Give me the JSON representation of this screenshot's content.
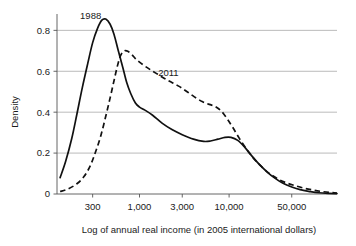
{
  "chart_data": {
    "type": "line",
    "title": "",
    "xlabel": "Log of annual real income (in 2005 international dollars)",
    "ylabel": "Density",
    "xscale": "log",
    "xlim": [
      120,
      160000
    ],
    "ylim": [
      0,
      0.88
    ],
    "xticks": [
      300,
      1000,
      3000,
      10000,
      50000
    ],
    "xtick_labels": [
      "300",
      "1,000",
      "3,000",
      "10,000",
      "50,000"
    ],
    "yticks": [
      0,
      0.2,
      0.4,
      0.6,
      0.8
    ],
    "ytick_labels": [
      "0",
      "0.2",
      "0.4",
      "0.6",
      "0.8"
    ],
    "grid": "horizontal",
    "legend_position": "inline-annotations",
    "series": [
      {
        "name": "1988",
        "style": "solid",
        "label_x": 285,
        "label_y": 0.855,
        "points": [
          [
            130,
            0.08
          ],
          [
            150,
            0.16
          ],
          [
            175,
            0.27
          ],
          [
            200,
            0.39
          ],
          [
            230,
            0.52
          ],
          [
            265,
            0.64
          ],
          [
            300,
            0.74
          ],
          [
            340,
            0.81
          ],
          [
            380,
            0.85
          ],
          [
            420,
            0.855
          ],
          [
            470,
            0.83
          ],
          [
            520,
            0.78
          ],
          [
            580,
            0.7
          ],
          [
            650,
            0.62
          ],
          [
            720,
            0.545
          ],
          [
            800,
            0.49
          ],
          [
            900,
            0.445
          ],
          [
            1000,
            0.425
          ],
          [
            1150,
            0.41
          ],
          [
            1400,
            0.385
          ],
          [
            1800,
            0.345
          ],
          [
            2300,
            0.315
          ],
          [
            3000,
            0.29
          ],
          [
            4000,
            0.268
          ],
          [
            5200,
            0.257
          ],
          [
            6200,
            0.259
          ],
          [
            7500,
            0.268
          ],
          [
            9000,
            0.277
          ],
          [
            10500,
            0.277
          ],
          [
            12500,
            0.262
          ],
          [
            15000,
            0.228
          ],
          [
            18000,
            0.185
          ],
          [
            22000,
            0.142
          ],
          [
            27000,
            0.105
          ],
          [
            33000,
            0.075
          ],
          [
            40000,
            0.052
          ],
          [
            50000,
            0.034
          ],
          [
            62000,
            0.021
          ],
          [
            80000,
            0.012
          ],
          [
            100000,
            0.006
          ],
          [
            130000,
            0.003
          ],
          [
            160000,
            0.002
          ]
        ]
      },
      {
        "name": "2011",
        "style": "dashed",
        "label_x": 2100,
        "label_y": 0.575,
        "points": [
          [
            130,
            0.012
          ],
          [
            160,
            0.025
          ],
          [
            200,
            0.05
          ],
          [
            240,
            0.085
          ],
          [
            280,
            0.135
          ],
          [
            320,
            0.2
          ],
          [
            370,
            0.285
          ],
          [
            420,
            0.38
          ],
          [
            470,
            0.47
          ],
          [
            520,
            0.555
          ],
          [
            570,
            0.63
          ],
          [
            620,
            0.68
          ],
          [
            680,
            0.7
          ],
          [
            740,
            0.698
          ],
          [
            820,
            0.682
          ],
          [
            900,
            0.662
          ],
          [
            1000,
            0.645
          ],
          [
            1150,
            0.625
          ],
          [
            1350,
            0.605
          ],
          [
            1600,
            0.585
          ],
          [
            1900,
            0.565
          ],
          [
            2300,
            0.545
          ],
          [
            2800,
            0.525
          ],
          [
            3400,
            0.5
          ],
          [
            4100,
            0.475
          ],
          [
            5000,
            0.452
          ],
          [
            6000,
            0.438
          ],
          [
            7000,
            0.428
          ],
          [
            8200,
            0.405
          ],
          [
            9500,
            0.368
          ],
          [
            11000,
            0.325
          ],
          [
            13000,
            0.272
          ],
          [
            15500,
            0.222
          ],
          [
            18500,
            0.178
          ],
          [
            22000,
            0.142
          ],
          [
            26000,
            0.112
          ],
          [
            31000,
            0.088
          ],
          [
            37000,
            0.068
          ],
          [
            45000,
            0.052
          ],
          [
            55000,
            0.04
          ],
          [
            68000,
            0.029
          ],
          [
            85000,
            0.02
          ],
          [
            105000,
            0.013
          ],
          [
            130000,
            0.008
          ],
          [
            160000,
            0.005
          ]
        ]
      }
    ]
  }
}
